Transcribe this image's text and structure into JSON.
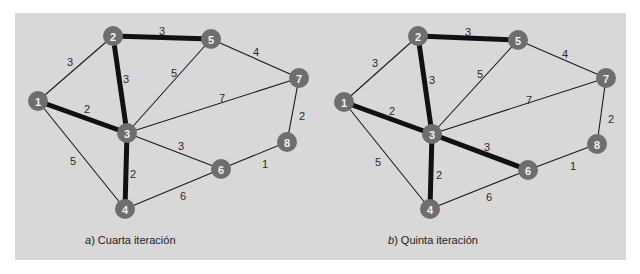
{
  "figure": {
    "panels": [
      {
        "id": "a",
        "caption_letter": "a",
        "caption_text": ") Cuarta iteración",
        "nodes": [
          {
            "id": "1",
            "x": 38,
            "y": 101
          },
          {
            "id": "2",
            "x": 113,
            "y": 36
          },
          {
            "id": "3",
            "x": 127,
            "y": 133
          },
          {
            "id": "4",
            "x": 125,
            "y": 209
          },
          {
            "id": "5",
            "x": 211,
            "y": 39
          },
          {
            "id": "6",
            "x": 221,
            "y": 169
          },
          {
            "id": "7",
            "x": 299,
            "y": 78
          },
          {
            "id": "8",
            "x": 287,
            "y": 142
          }
        ],
        "edges": [
          {
            "from": "1",
            "to": "2",
            "weight": "3",
            "selected": false,
            "lx": 70,
            "ly": 62
          },
          {
            "from": "1",
            "to": "3",
            "weight": "2",
            "selected": true,
            "lx": 87,
            "ly": 109
          },
          {
            "from": "1",
            "to": "4",
            "weight": "5",
            "selected": false,
            "lx": 73,
            "ly": 161
          },
          {
            "from": "2",
            "to": "3",
            "weight": "3",
            "selected": true,
            "lx": 126,
            "ly": 79
          },
          {
            "from": "2",
            "to": "5",
            "weight": "3",
            "selected": true,
            "lx": 162,
            "ly": 31
          },
          {
            "from": "3",
            "to": "5",
            "weight": "5",
            "selected": false,
            "lx": 174,
            "ly": 73
          },
          {
            "from": "3",
            "to": "7",
            "weight": "7",
            "selected": false,
            "lx": 222,
            "ly": 98
          },
          {
            "from": "3",
            "to": "6",
            "weight": "3",
            "selected": false,
            "lx": 181,
            "ly": 146
          },
          {
            "from": "3",
            "to": "4",
            "weight": "2",
            "selected": true,
            "lx": 133,
            "ly": 174
          },
          {
            "from": "4",
            "to": "6",
            "weight": "6",
            "selected": false,
            "lx": 183,
            "ly": 196
          },
          {
            "from": "5",
            "to": "7",
            "weight": "4",
            "selected": false,
            "lx": 256,
            "ly": 52
          },
          {
            "from": "7",
            "to": "8",
            "weight": "2",
            "selected": false,
            "lx": 302,
            "ly": 116
          },
          {
            "from": "6",
            "to": "8",
            "weight": "1",
            "selected": false,
            "lx": 265,
            "ly": 164
          }
        ]
      },
      {
        "id": "b",
        "caption_letter": "b",
        "caption_text": ") Quinta iteración",
        "nodes": [
          {
            "id": "1",
            "x": 344,
            "y": 102
          },
          {
            "id": "2",
            "x": 418,
            "y": 36
          },
          {
            "id": "3",
            "x": 432,
            "y": 134
          },
          {
            "id": "4",
            "x": 430,
            "y": 209
          },
          {
            "id": "5",
            "x": 518,
            "y": 40
          },
          {
            "id": "6",
            "x": 528,
            "y": 170
          },
          {
            "id": "7",
            "x": 606,
            "y": 78
          },
          {
            "id": "8",
            "x": 597,
            "y": 144
          }
        ],
        "edges": [
          {
            "from": "1",
            "to": "2",
            "weight": "3",
            "selected": false,
            "lx": 375,
            "ly": 63
          },
          {
            "from": "1",
            "to": "3",
            "weight": "2",
            "selected": true,
            "lx": 392,
            "ly": 111
          },
          {
            "from": "1",
            "to": "4",
            "weight": "5",
            "selected": false,
            "lx": 378,
            "ly": 162
          },
          {
            "from": "2",
            "to": "3",
            "weight": "3",
            "selected": true,
            "lx": 432,
            "ly": 80
          },
          {
            "from": "2",
            "to": "5",
            "weight": "3",
            "selected": true,
            "lx": 468,
            "ly": 32
          },
          {
            "from": "3",
            "to": "5",
            "weight": "5",
            "selected": false,
            "lx": 480,
            "ly": 74
          },
          {
            "from": "3",
            "to": "7",
            "weight": "7",
            "selected": false,
            "lx": 529,
            "ly": 100
          },
          {
            "from": "3",
            "to": "6",
            "weight": "3",
            "selected": true,
            "lx": 487,
            "ly": 147
          },
          {
            "from": "3",
            "to": "4",
            "weight": "2",
            "selected": true,
            "lx": 439,
            "ly": 175
          },
          {
            "from": "4",
            "to": "6",
            "weight": "6",
            "selected": false,
            "lx": 489,
            "ly": 197
          },
          {
            "from": "5",
            "to": "7",
            "weight": "4",
            "selected": false,
            "lx": 565,
            "ly": 54
          },
          {
            "from": "7",
            "to": "8",
            "weight": "2",
            "selected": false,
            "lx": 611,
            "ly": 119
          },
          {
            "from": "6",
            "to": "8",
            "weight": "1",
            "selected": false,
            "lx": 573,
            "ly": 166
          }
        ]
      }
    ],
    "colors": {
      "panel_background": "#d8d8d8",
      "node_fill": "#6e6e6e",
      "node_label": "#f2f2f2",
      "edge": "#1a1a1a",
      "selected_edge": "#111111"
    }
  }
}
